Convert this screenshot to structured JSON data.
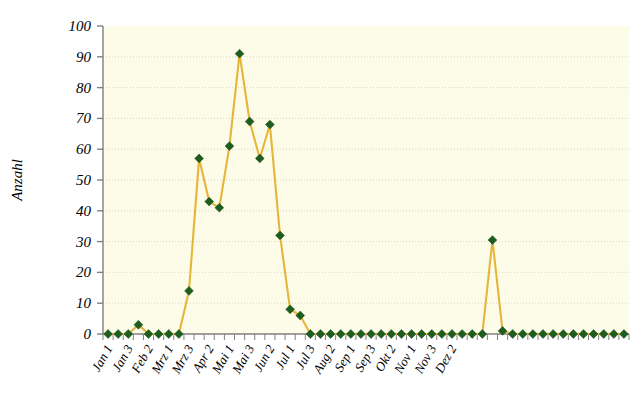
{
  "chart_data": {
    "type": "line",
    "title": "",
    "subtitle": "",
    "xlabel": "",
    "ylabel": "Anzahl",
    "ylim": [
      0,
      100
    ],
    "ytick_step": 10,
    "yticks": [
      "0",
      "10",
      "20",
      "30",
      "40",
      "50",
      "60",
      "70",
      "80",
      "90",
      "100"
    ],
    "grid": "horizontal-dotted",
    "legend": "none",
    "marker": "diamond",
    "colors": {
      "line": "#E8B53A",
      "marker_fill": "#1F5C1F",
      "plot_background": "#FCFCE8",
      "axis": "#808080",
      "gridline": "#D8D8C0",
      "page_background": "#FFFFFF",
      "text": "#000000"
    },
    "x_tick_count": 52,
    "x_labels_every": 2,
    "x_tick_labels": [
      "Jan 1",
      "",
      "Jan 3",
      "",
      "Feb 2",
      "",
      "Mrz 1",
      "",
      "Mrz 3",
      "",
      "Apr 2",
      "",
      "Mai 1",
      "",
      "Mai 3",
      "",
      "Jun 2",
      "",
      "Jul 1",
      "",
      "Jul 3",
      "",
      "Aug 2",
      "",
      "Sep 1",
      "",
      "Sep 3",
      "",
      "Okt 2",
      "",
      "Nov 1",
      "",
      "Nov 3",
      "",
      "Dez 2",
      ""
    ],
    "x_labels_visible": [
      "Jan 1",
      "Jan 3",
      "Feb 2",
      "Mrz 1",
      "Mrz 3",
      "Apr 2",
      "Mai 1",
      "Mai 3",
      "Jun 2",
      "Jul 1",
      "Jul 3",
      "Aug 2",
      "Sep 1",
      "Sep 3",
      "Okt 2",
      "Nov 1",
      "Nov 3",
      "Dez 2"
    ],
    "categories": [
      "Jan 1",
      "Jan 2",
      "Jan 3",
      "Jan 4",
      "Feb 1",
      "Feb 2",
      "Feb 3",
      "Feb 4",
      "Mrz 1",
      "Mrz 2",
      "Mrz 3",
      "Mrz 4",
      "Apr 1",
      "Apr 2",
      "Apr 3",
      "Apr 4",
      "Mai 1",
      "Mai 2",
      "Mai 3",
      "Mai 4",
      "Jun 1",
      "Jun 2",
      "Jun 3",
      "Jun 4",
      "Jul 1",
      "Jul 2",
      "Jul 3",
      "Jul 4",
      "Aug 1",
      "Aug 2",
      "Aug 3",
      "Aug 4",
      "Sep 1",
      "Sep 2",
      "Sep 3",
      "Sep 4",
      "Okt 1",
      "Okt 2",
      "Okt 3",
      "Okt 4",
      "Nov 1",
      "Nov 2",
      "Nov 3",
      "Nov 4",
      "Dez 1",
      "Dez 2",
      "Dez 3",
      "Dez 4",
      "Dez 5",
      "Dez 6",
      "Dez 7",
      "Dez 8"
    ],
    "values": [
      0,
      0,
      0,
      3,
      0,
      0,
      0,
      0,
      14,
      57,
      43,
      41,
      61,
      91,
      69,
      57,
      68,
      32,
      8,
      6,
      0,
      0,
      0,
      0,
      0,
      0,
      0,
      0,
      0,
      0,
      0,
      0,
      0,
      0,
      0,
      0,
      0,
      0,
      30.5,
      1,
      0,
      0,
      0,
      0,
      0,
      0,
      0,
      0,
      0,
      0,
      0,
      0
    ],
    "annotations": [
      {
        "label": "peak",
        "value": 91
      },
      {
        "label": "autumn-spike",
        "value": 30.5
      }
    ]
  }
}
